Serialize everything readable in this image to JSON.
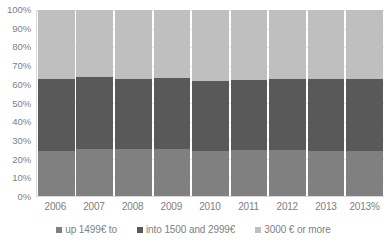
{
  "chart_data": {
    "type": "bar",
    "subtype": "stacked-percent",
    "title": "",
    "xlabel": "",
    "ylabel": "",
    "ylim": [
      0,
      100
    ],
    "y_ticks": [
      "0%",
      "10%",
      "20%",
      "30%",
      "40%",
      "50%",
      "60%",
      "70%",
      "80%",
      "90%",
      "100%"
    ],
    "y_tick_values": [
      0,
      10,
      20,
      30,
      40,
      50,
      60,
      70,
      80,
      90,
      100
    ],
    "grid": true,
    "legend_position": "bottom",
    "categories": [
      "2006",
      "2007",
      "2008",
      "2009",
      "2010",
      "2011",
      "2012",
      "2013",
      "2013%"
    ],
    "series": [
      {
        "name": "up 1499€ to",
        "color": "#808080",
        "values": [
          24,
          25.5,
          25.5,
          25.5,
          24,
          25,
          25,
          24,
          24
        ]
      },
      {
        "name": "into 1500 and 2999€",
        "color": "#595959",
        "values": [
          39,
          38.5,
          37.5,
          38,
          38,
          37.5,
          38,
          39,
          39
        ]
      },
      {
        "name": "3000 € or more",
        "color": "#bfbfbf",
        "values": [
          37,
          36,
          37,
          36.5,
          38,
          37.5,
          37,
          37,
          37
        ]
      }
    ],
    "cumulative_tops": [
      [
        24,
        63,
        100
      ],
      [
        25.5,
        64,
        100
      ],
      [
        25.5,
        63,
        100
      ],
      [
        25.5,
        63.5,
        100
      ],
      [
        24,
        62,
        100
      ],
      [
        25,
        62.5,
        100
      ],
      [
        25,
        63,
        100
      ],
      [
        24,
        63,
        100
      ],
      [
        24,
        63,
        100
      ]
    ]
  },
  "legend": {
    "items": [
      {
        "label": "up 1499€ to",
        "color": "#808080",
        "marker": "square-swatch-icon"
      },
      {
        "label": "into 1500 and 2999€",
        "color": "#595959",
        "marker": "square-swatch-icon"
      },
      {
        "label": "3000 € or more",
        "color": "#bfbfbf",
        "marker": "square-swatch-icon"
      }
    ]
  },
  "colors": {
    "low": "#808080",
    "mid": "#595959",
    "high": "#bfbfbf",
    "grid": "#e8e8e8",
    "axis": "#d9d9d9",
    "text": "#808080",
    "background": "#ffffff"
  }
}
